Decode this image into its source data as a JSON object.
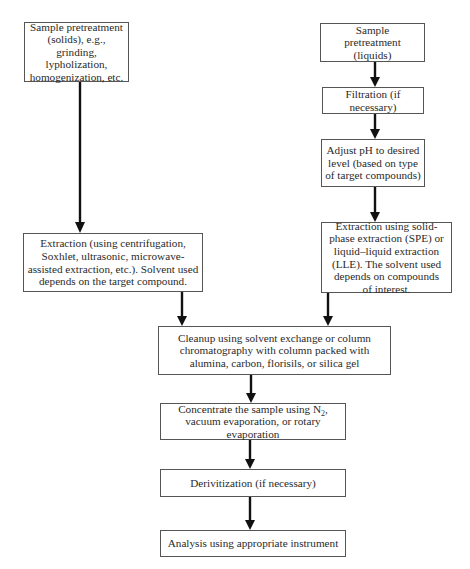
{
  "diagram": {
    "type": "flowchart",
    "nodes": [
      {
        "id": "pretreat_solids",
        "text": "Sample pretreatment (solids), e.g., grinding, lypholization, homogenization, etc."
      },
      {
        "id": "pretreat_liquids",
        "text": "Sample pretreatment (liquids)"
      },
      {
        "id": "filtration",
        "text": "Filtration (if necessary)"
      },
      {
        "id": "adjust_ph",
        "text": "Adjust pH to desired level (based on type of target compounds)"
      },
      {
        "id": "extraction_solids",
        "text": "Extraction (using centrifugation, Soxhlet, ultrasonic, microwave-assisted extraction, etc.). Solvent used depends on the target compound."
      },
      {
        "id": "extraction_liquids",
        "text": "Extraction using solid-phase extraction (SPE) or liquid–liquid extraction (LLE). The solvent used depends on compounds of interest."
      },
      {
        "id": "cleanup",
        "text": "Cleanup using solvent exchange or column chromatography with column packed with alumina, carbon, florisils, or silica gel"
      },
      {
        "id": "concentrate",
        "text_before_sub": "Concentrate the sample using N",
        "subscript": "2",
        "text_after_sub": ", vacuum evaporation, or rotary evaporation"
      },
      {
        "id": "derivitization",
        "text": "Derivitization (if necessary)"
      },
      {
        "id": "analysis",
        "text": "Analysis using appropriate instrument"
      }
    ],
    "edges": [
      [
        "pretreat_solids",
        "extraction_solids"
      ],
      [
        "pretreat_liquids",
        "filtration"
      ],
      [
        "filtration",
        "adjust_ph"
      ],
      [
        "adjust_ph",
        "extraction_liquids"
      ],
      [
        "extraction_solids",
        "cleanup"
      ],
      [
        "extraction_liquids",
        "cleanup"
      ],
      [
        "cleanup",
        "concentrate"
      ],
      [
        "concentrate",
        "derivitization"
      ],
      [
        "derivitization",
        "analysis"
      ]
    ]
  }
}
